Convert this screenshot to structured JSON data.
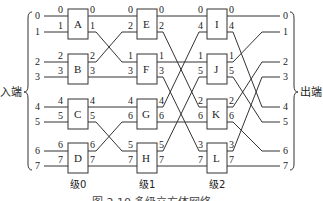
{
  "diagram": {
    "input_label": "入端",
    "output_label": "出端",
    "caption": "图 2.10  多级立方体网络",
    "inputs": [
      "0",
      "1",
      "2",
      "3",
      "4",
      "5",
      "6",
      "7"
    ],
    "outputs": [
      "0",
      "1",
      "2",
      "3",
      "4",
      "5",
      "6",
      "7"
    ],
    "stages": [
      {
        "label": "级0",
        "boxes": [
          {
            "name": "A",
            "in": [
              "0",
              "1"
            ],
            "out": [
              "0",
              "1"
            ]
          },
          {
            "name": "B",
            "in": [
              "2",
              "3"
            ],
            "out": [
              "2",
              "3"
            ]
          },
          {
            "name": "C",
            "in": [
              "4",
              "5"
            ],
            "out": [
              "4",
              "5"
            ]
          },
          {
            "name": "D",
            "in": [
              "6",
              "7"
            ],
            "out": [
              "6",
              "7"
            ]
          }
        ]
      },
      {
        "label": "级1",
        "boxes": [
          {
            "name": "E",
            "in": [
              "0",
              "2"
            ],
            "out": [
              "0",
              "2"
            ]
          },
          {
            "name": "F",
            "in": [
              "1",
              "3"
            ],
            "out": [
              "1",
              "3"
            ]
          },
          {
            "name": "G",
            "in": [
              "4",
              "6"
            ],
            "out": [
              "4",
              "6"
            ]
          },
          {
            "name": "H",
            "in": [
              "5",
              "7"
            ],
            "out": [
              "5",
              "7"
            ]
          }
        ]
      },
      {
        "label": "级2",
        "boxes": [
          {
            "name": "I",
            "in": [
              "0",
              "4"
            ],
            "out": [
              "0",
              "4"
            ]
          },
          {
            "name": "J",
            "in": [
              "1",
              "5"
            ],
            "out": [
              "1",
              "5"
            ]
          },
          {
            "name": "K",
            "in": [
              "2",
              "6"
            ],
            "out": [
              "2",
              "6"
            ]
          },
          {
            "name": "L",
            "in": [
              "3",
              "7"
            ],
            "out": [
              "3",
              "7"
            ]
          }
        ]
      }
    ]
  }
}
